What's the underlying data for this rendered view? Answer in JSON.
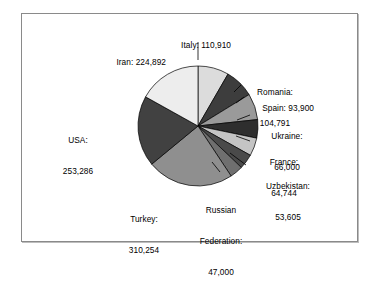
{
  "chart_data": {
    "type": "pie",
    "title": "",
    "subtitle": "",
    "xlabel": "",
    "ylabel": "",
    "legend_position": "none",
    "grid": false,
    "label_format": "name: value",
    "start_angle_deg": 0,
    "direction": "clockwise",
    "total": 1375682,
    "categories": [
      "Italy",
      "Romania",
      "Spain",
      "Ukraine",
      "France",
      "Uzbekistan",
      "Russian Federation",
      "Turkey",
      "USA",
      "Iran"
    ],
    "values": [
      110910,
      104791,
      93900,
      66000,
      64744,
      53605,
      47000,
      310254,
      253286,
      224892
    ],
    "value_labels": [
      "110,910",
      "104,791",
      "93,900",
      "66,000",
      "64,744",
      "53,605",
      "47,000",
      "310,254",
      "253,286",
      "224,892"
    ],
    "slices": [
      {
        "name": "Italy",
        "value": 110910,
        "value_label": "110,910",
        "label": "Italy: 110,910",
        "color": "#dcdcdc",
        "percent": 8.06
      },
      {
        "name": "Romania",
        "value": 104791,
        "value_label": "104,791",
        "label": "Romania:\n104,791",
        "color": "#3d3d3d",
        "percent": 7.62
      },
      {
        "name": "Spain",
        "value": 93900,
        "value_label": "93,900",
        "label": "Spain: 93,900",
        "color": "#9a9a9a",
        "percent": 6.83
      },
      {
        "name": "Ukraine",
        "value": 66000,
        "value_label": "66,000",
        "label": "Ukraine:\n66,000",
        "color": "#2e2e2e",
        "percent": 4.8
      },
      {
        "name": "France",
        "value": 64744,
        "value_label": "64,744",
        "label": "France:\n64,744",
        "color": "#c4c4c4",
        "percent": 4.71
      },
      {
        "name": "Uzbekistan",
        "value": 53605,
        "value_label": "53,605",
        "label": "Uzbekistan:\n53,605",
        "color": "#4a4a4a",
        "percent": 3.9
      },
      {
        "name": "Russian Federation",
        "value": 47000,
        "value_label": "47,000",
        "label": "Russian\nFederation:\n47,000",
        "color": "#6f6f6f",
        "percent": 3.42
      },
      {
        "name": "Turkey",
        "value": 310254,
        "value_label": "310,254",
        "label": "Turkey:\n310,254",
        "color": "#8f8f8f",
        "percent": 22.55
      },
      {
        "name": "USA",
        "value": 253286,
        "value_label": "253,286",
        "label": "USA:\n253,286",
        "color": "#414141",
        "percent": 18.41
      },
      {
        "name": "Iran",
        "value": 224892,
        "value_label": "224,892",
        "label": "Iran: 224,892",
        "color": "#ededed",
        "percent": 16.35
      }
    ]
  },
  "labels": {
    "italy": "Italy: 110,910",
    "iran": "Iran: 224,892",
    "romania_line1": "Romania:",
    "romania_line2": "104,791",
    "spain": "Spain: 93,900",
    "ukraine_line1": "Ukraine:",
    "ukraine_line2": "66,000",
    "france_line1": "France:",
    "france_line2": "64,744",
    "uzbekistan_line1": "Uzbekistan:",
    "uzbekistan_line2": "53,605",
    "russia_line1": "Russian",
    "russia_line2": "Federation:",
    "russia_line3": "47,000",
    "turkey_line1": "Turkey:",
    "turkey_line2": "310,254",
    "usa_line1": "USA:",
    "usa_line2": "253,286"
  },
  "colors": {
    "frame_border": "#8a8a8a",
    "background": "#ffffff",
    "text": "#000000",
    "slice_outline": "#000000",
    "leader_line": "#000000"
  }
}
